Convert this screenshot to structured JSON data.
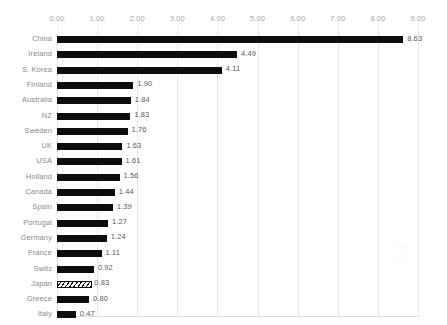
{
  "chart_data": {
    "type": "bar",
    "orientation": "horizontal",
    "title": "",
    "subtitle": "",
    "xlabel": "",
    "ylabel": "",
    "xlim": [
      0.0,
      9.0
    ],
    "xtick_step": 1.0,
    "xticks": [
      "0.00",
      "1.00",
      "2.00",
      "3.00",
      "4.00",
      "5.00",
      "6.00",
      "7.00",
      "8.00",
      "9.00"
    ],
    "xtick_values": [
      0,
      1,
      2,
      3,
      4,
      5,
      6,
      7,
      8,
      9
    ],
    "grid": true,
    "grid_axis": "x",
    "legend": false,
    "legend_position": "none",
    "axis_position": "top",
    "data_labels": true,
    "categories": [
      "China",
      "Ireland",
      "S. Korea",
      "Finland",
      "Australia",
      "NZ",
      "Sweden",
      "UK",
      "USA",
      "Holland",
      "Canada",
      "Spain",
      "Portugal",
      "Germany",
      "France",
      "Switz",
      "Japan",
      "Greece",
      "Italy"
    ],
    "values": [
      8.63,
      4.49,
      4.11,
      1.9,
      1.84,
      1.83,
      1.76,
      1.63,
      1.61,
      1.56,
      1.44,
      1.39,
      1.27,
      1.24,
      1.11,
      0.92,
      0.83,
      0.8,
      0.47
    ],
    "value_labels": [
      "8.63",
      "4.49",
      "4.11",
      "1.90",
      "1.84",
      "1.83",
      "1.76",
      "1.63",
      "1.61",
      "1.56",
      "1.44",
      "1.39",
      "1.27",
      "1.24",
      "1.11",
      "0.92",
      "0.83",
      "0.80",
      "0.47"
    ],
    "bars": [
      {
        "category": "China",
        "value": 8.63,
        "label": "8.63",
        "fill": "solid"
      },
      {
        "category": "Ireland",
        "value": 4.49,
        "label": "4.49",
        "fill": "solid"
      },
      {
        "category": "S. Korea",
        "value": 4.11,
        "label": "4.11",
        "fill": "solid"
      },
      {
        "category": "Finland",
        "value": 1.9,
        "label": "1.90",
        "fill": "solid"
      },
      {
        "category": "Australia",
        "value": 1.84,
        "label": "1.84",
        "fill": "solid"
      },
      {
        "category": "NZ",
        "value": 1.83,
        "label": "1.83",
        "fill": "solid"
      },
      {
        "category": "Sweden",
        "value": 1.76,
        "label": "1.76",
        "fill": "solid"
      },
      {
        "category": "UK",
        "value": 1.63,
        "label": "1.63",
        "fill": "solid"
      },
      {
        "category": "USA",
        "value": 1.61,
        "label": "1.61",
        "fill": "solid"
      },
      {
        "category": "Holland",
        "value": 1.56,
        "label": "1.56",
        "fill": "solid"
      },
      {
        "category": "Canada",
        "value": 1.44,
        "label": "1.44",
        "fill": "solid"
      },
      {
        "category": "Spain",
        "value": 1.39,
        "label": "1.39",
        "fill": "solid"
      },
      {
        "category": "Portugal",
        "value": 1.27,
        "label": "1.27",
        "fill": "solid"
      },
      {
        "category": "Germany",
        "value": 1.24,
        "label": "1.24",
        "fill": "solid"
      },
      {
        "category": "France",
        "value": 1.11,
        "label": "1.11",
        "fill": "solid"
      },
      {
        "category": "Switz",
        "value": 0.92,
        "label": "0.92",
        "fill": "solid"
      },
      {
        "category": "Japan",
        "value": 0.83,
        "label": "0.83",
        "fill": "hatched"
      },
      {
        "category": "Greece",
        "value": 0.8,
        "label": "0.80",
        "fill": "solid"
      },
      {
        "category": "Italy",
        "value": 0.47,
        "label": "0.47",
        "fill": "solid"
      }
    ],
    "colors": {
      "bar_fill": "#0d0d0d",
      "highlight_bar_fill": "#ffffff",
      "highlight_bar_stroke": "#111111",
      "gridline": "#e8e8e8",
      "axis_line": "#dcdcdc",
      "tick_label": "#a6a6a6",
      "category_label": "#8c8c8c",
      "value_label": "#5a5a5a",
      "background": "#ffffff"
    }
  }
}
